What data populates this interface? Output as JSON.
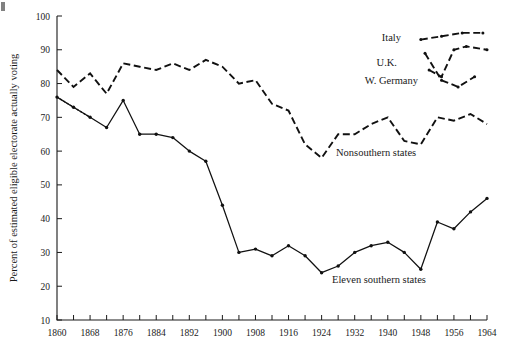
{
  "figure": {
    "ylabel": "Percent of estimated eligible electorate actually voting",
    "annotations": {
      "italy": "Italy",
      "uk": "U.K.",
      "wgermany": "W. Germany",
      "nonsouthern": "Nonsouthern states",
      "southern": "Eleven southern states"
    },
    "ink_color": "#111111"
  },
  "chart_data": {
    "type": "line",
    "title": "",
    "xlabel": "",
    "ylabel": "Percent of estimated eligible electorate actually voting",
    "xlim": [
      1860,
      1964
    ],
    "ylim": [
      10,
      100
    ],
    "grid": false,
    "legend": "inline-annotations",
    "yticks": [
      10,
      20,
      30,
      40,
      50,
      60,
      70,
      80,
      90,
      100
    ],
    "xticks_major": [
      1860,
      1868,
      1876,
      1884,
      1892,
      1900,
      1908,
      1916,
      1924,
      1932,
      1940,
      1948,
      1956,
      1964
    ],
    "xticks_minor_step": 4,
    "series": [
      {
        "name": "Nonsouthern states",
        "style": "dashed",
        "x": [
          1860,
          1864,
          1868,
          1872,
          1876,
          1880,
          1884,
          1888,
          1892,
          1896,
          1900,
          1904,
          1908,
          1912,
          1916,
          1920,
          1924,
          1928,
          1932,
          1936,
          1940,
          1944,
          1948,
          1952,
          1956,
          1960,
          1964
        ],
        "values": [
          84,
          79,
          83,
          77,
          86,
          85,
          84,
          86,
          84,
          87,
          85,
          80,
          81,
          74,
          72,
          62,
          58,
          65,
          65,
          68,
          70,
          63,
          62,
          70,
          69,
          71,
          68
        ]
      },
      {
        "name": "Eleven southern states",
        "style": "solid",
        "x": [
          1860,
          1864,
          1868,
          1872,
          1876,
          1880,
          1884,
          1888,
          1892,
          1896,
          1900,
          1904,
          1908,
          1912,
          1916,
          1920,
          1924,
          1928,
          1932,
          1936,
          1940,
          1944,
          1948,
          1952,
          1956,
          1960,
          1964
        ],
        "values": [
          76,
          73,
          70,
          67,
          75,
          65,
          65,
          64,
          60,
          57,
          44,
          30,
          31,
          29,
          32,
          29,
          24,
          26,
          30,
          32,
          33,
          30,
          25,
          39,
          37,
          42,
          46
        ],
        "dotted_segment": {
          "x": [
            1860,
            1868
          ],
          "values": [
            76,
            70
          ]
        }
      },
      {
        "name": "Italy",
        "style": "dashed",
        "x": [
          1948,
          1953,
          1958,
          1963
        ],
        "values": [
          93,
          94,
          95,
          95
        ]
      },
      {
        "name": "U.K.",
        "style": "dashed",
        "x": [
          1950,
          1953,
          1956,
          1959,
          1964
        ],
        "values": [
          84,
          82,
          90,
          91,
          90
        ]
      },
      {
        "name": "W. Germany",
        "style": "dashed",
        "x": [
          1949,
          1953,
          1957,
          1961
        ],
        "values": [
          89,
          81,
          79,
          82
        ]
      }
    ]
  }
}
